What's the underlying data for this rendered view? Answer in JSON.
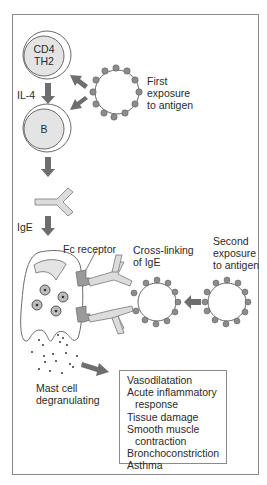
{
  "colors": {
    "cell_fill": "#e4e4e4",
    "cell_outline": "#6a6a6a",
    "antigen_dot": "#8c8c8c",
    "arrow": "#6e6e6e",
    "antibody_fill": "#dcdcdc",
    "receptor_fill": "#9a9a9a",
    "frame": "#8a8a8a"
  },
  "cells": {
    "th2": {
      "line1": "CD4",
      "line2": "TH2"
    },
    "b_cell": {
      "label": "B"
    }
  },
  "labels": {
    "il4": "IL-4",
    "ige": "IgE",
    "first_exposure": [
      "First",
      "exposure",
      "to antigen"
    ],
    "fc_receptor": "Fc receptor",
    "cross_linking": [
      "Cross-linking",
      "of IgE"
    ],
    "second_exposure": [
      "Second",
      "exposure",
      "to antigen"
    ],
    "mast_cell": [
      "Mast cell",
      "degranulating"
    ]
  },
  "effects": {
    "items": [
      {
        "text": "Vasodilatation",
        "indent": false
      },
      {
        "text": "Acute inflammatory",
        "indent": false
      },
      {
        "text": "response",
        "indent": true
      },
      {
        "text": "Tissue damage",
        "indent": false
      },
      {
        "text": "Smooth muscle",
        "indent": false
      },
      {
        "text": "contraction",
        "indent": true
      },
      {
        "text": "Bronchoconstriction",
        "indent": false
      },
      {
        "text": "Asthma",
        "indent": false
      }
    ]
  }
}
